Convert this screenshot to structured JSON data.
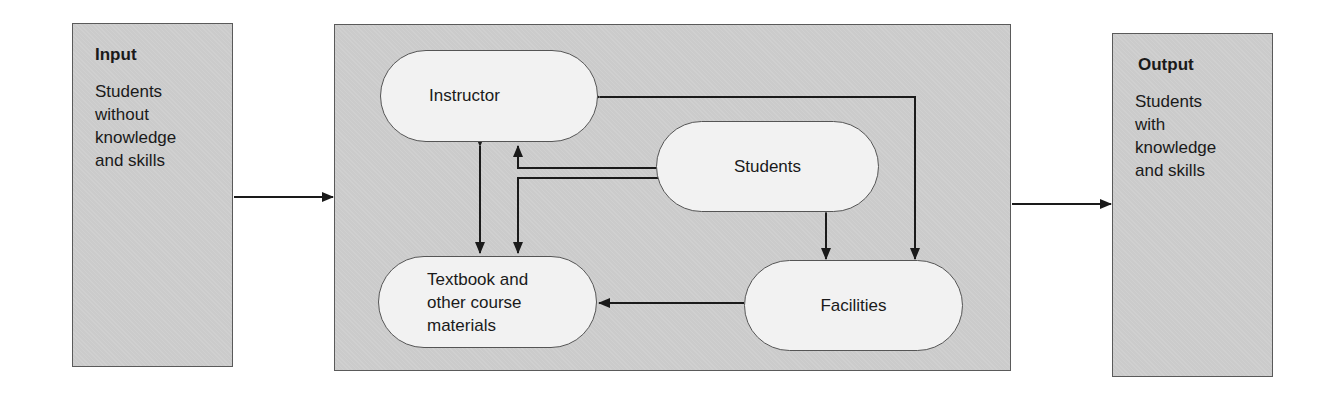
{
  "diagram": {
    "type": "input-process-output",
    "input": {
      "title": "Input",
      "text": "Students\nwithout\nknowledge\nand skills"
    },
    "process": {
      "nodes": {
        "instructor": "Instructor",
        "students": "Students",
        "textbook": "Textbook and\nother course\nmaterials",
        "facilities": "Facilities"
      },
      "edges": [
        {
          "from": "instructor",
          "to": "textbook",
          "direction": "bidirectional"
        },
        {
          "from": "students",
          "to": "instructor",
          "direction": "one-way"
        },
        {
          "from": "students",
          "to": "textbook",
          "direction": "one-way"
        },
        {
          "from": "students",
          "to": "facilities",
          "direction": "bidirectional"
        },
        {
          "from": "instructor",
          "to": "facilities",
          "direction": "bidirectional"
        },
        {
          "from": "facilities",
          "to": "textbook",
          "direction": "one-way"
        }
      ]
    },
    "output": {
      "title": "Output",
      "text": "Students\nwith\nknowledge\nand skills"
    },
    "colors": {
      "box_fill": "#cbcbcb",
      "node_fill": "#f2f2f2",
      "stroke": "#1a1a1a"
    }
  }
}
